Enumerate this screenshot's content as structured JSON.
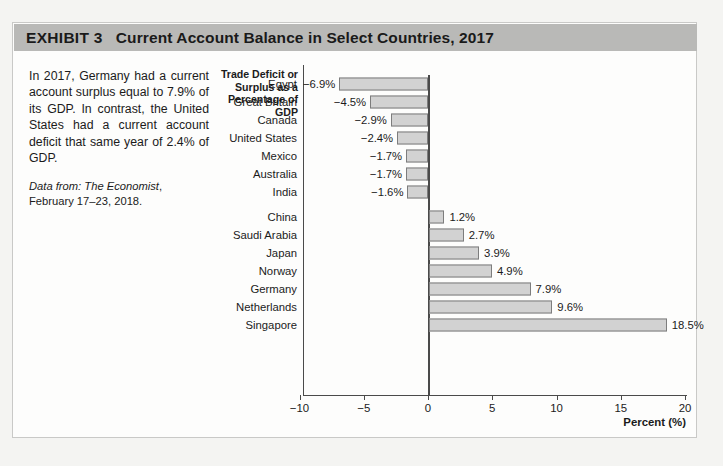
{
  "exhibit": {
    "label": "EXHIBIT",
    "number": "3",
    "title": "Current Account Balance in Select Countries, 2017"
  },
  "caption": {
    "body": "In 2017, Germany had a current account surplus equal to 7.9% of its GDP. In contrast, the United States had a current account deficit that same year of 2.4% of GDP.",
    "source_prefix": "Data from: ",
    "source_italic": "The Economist",
    "source_rest": ", February 17–23, 2018."
  },
  "colors": {
    "title_band": "#b9b9b7",
    "bar_fill": "#d2d2d2",
    "bar_border": "#7d7d7d",
    "axis": "#4a4a4a",
    "frame": "#c9c9c7",
    "page_background": "#f4f4f2"
  },
  "chart_data": {
    "type": "bar",
    "orientation": "horizontal",
    "title": "Current Account Balance in Select Countries, 2017",
    "category_axis_header": "Trade Deficit or Surplus as a Percentage of GDP",
    "xlabel": "Percent (%)",
    "ylabel": "",
    "xlim": [
      -10,
      20
    ],
    "xticks": [
      -10,
      -5,
      0,
      5,
      10,
      15,
      20
    ],
    "xtick_labels": [
      "−10",
      "−5",
      "0",
      "5",
      "10",
      "15",
      "20"
    ],
    "grid": false,
    "legend": null,
    "zero_reference_line": 0,
    "categories": [
      "Egypt",
      "Great Britain",
      "Canada",
      "United States",
      "Mexico",
      "Australia",
      "India",
      "China",
      "Saudi Arabia",
      "Japan",
      "Norway",
      "Germany",
      "Netherlands",
      "Singapore"
    ],
    "values": [
      -6.9,
      -4.5,
      -2.9,
      -2.4,
      -1.7,
      -1.7,
      -1.6,
      1.2,
      2.7,
      3.9,
      4.9,
      7.9,
      9.6,
      18.5
    ],
    "data_labels": [
      "−6.9%",
      "−4.5%",
      "−2.9%",
      "−2.4%",
      "−1.7%",
      "−1.7%",
      "−1.6%",
      "1.2%",
      "2.7%",
      "3.9%",
      "4.9%",
      "7.9%",
      "9.6%",
      "18.5%"
    ]
  }
}
